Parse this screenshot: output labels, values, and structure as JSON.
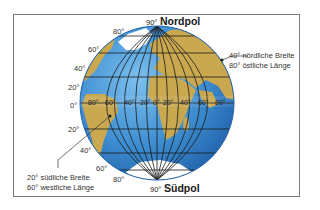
{
  "diagram": {
    "north_pole": {
      "degree": "90°",
      "name": "Nordpol"
    },
    "south_pole": {
      "degree": "90°",
      "name": "Südpol"
    },
    "latitude_labels_north": [
      "80°",
      "60°",
      "40°",
      "20°"
    ],
    "equator_label": "0°",
    "latitude_labels_south": [
      "20°",
      "40°",
      "60°",
      "80°"
    ],
    "longitude_labels": [
      "80°",
      "60°",
      "40°",
      "20°",
      "0°",
      "20°",
      "40°",
      "60°",
      "80°"
    ],
    "annotation_northeast": {
      "line1": "40° nördliche Breite",
      "line2": "80° östliche Länge"
    },
    "annotation_southwest": {
      "line1": "20° südliche Breite",
      "line2": "60° westliche Länge"
    },
    "colors": {
      "ocean": "#3f8fd2",
      "ocean_dark": "#1f5fa8",
      "land": "#c9a850",
      "ice": "#ffffff",
      "grid": "#1a1a1a",
      "frame": "#7a7a7a"
    }
  }
}
